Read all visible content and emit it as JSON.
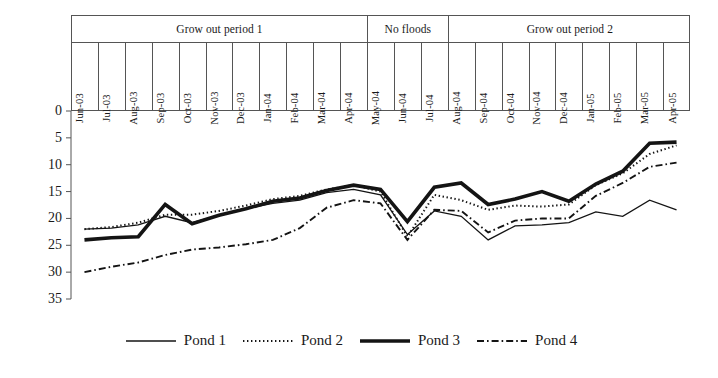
{
  "axis": {
    "y_ticks": [
      0,
      5,
      10,
      15,
      20,
      25,
      30,
      35
    ],
    "y_min": 0,
    "y_max": 35,
    "inverted": true
  },
  "groups": [
    {
      "label": "Grow out period 1",
      "start": 0,
      "end": 10
    },
    {
      "label": "No floods",
      "start": 11,
      "end": 13
    },
    {
      "label": "Grow out period 2",
      "start": 14,
      "end": 22
    }
  ],
  "legend": [
    {
      "label": "Pond 1",
      "style": "solid-thin"
    },
    {
      "label": "Pond 2",
      "style": "dotted"
    },
    {
      "label": "Pond 3",
      "style": "solid-thick"
    },
    {
      "label": "Pond 4",
      "style": "dash-dot"
    }
  ],
  "chart_data": {
    "type": "line",
    "title": "",
    "xlabel": "",
    "ylabel": "",
    "ylim": [
      0,
      35
    ],
    "y_inverted": true,
    "grid": false,
    "legend_position": "bottom",
    "annotations": [
      "Grow out period 1",
      "No floods",
      "Grow out period 2"
    ],
    "categories": [
      "Jun-03",
      "Jul-03",
      "Aug-03",
      "Sep-03",
      "Oct-03",
      "Nov-03",
      "Dec-03",
      "Jan-04",
      "Feb-04",
      "Mar-04",
      "Apr-04",
      "May-04",
      "Jun-04",
      "Jul-04",
      "Aug-04",
      "Sep-04",
      "Oct-04",
      "Nov-04",
      "Dec-04",
      "Jan-05",
      "Feb-05",
      "Mar-05",
      "Apr-05"
    ],
    "series": [
      {
        "name": "Pond 1",
        "style": "solid-thin",
        "values": [
          22.0,
          21.8,
          21.2,
          19.6,
          20.8,
          19.4,
          18.2,
          17.2,
          16.6,
          15.2,
          14.6,
          15.6,
          23.0,
          18.6,
          19.6,
          24.0,
          21.4,
          21.2,
          20.8,
          18.8,
          19.6,
          16.6,
          18.4
        ]
      },
      {
        "name": "Pond 2",
        "style": "dotted",
        "values": [
          22.0,
          21.6,
          20.8,
          19.3,
          19.3,
          18.6,
          17.6,
          16.4,
          15.8,
          14.6,
          13.8,
          15.0,
          23.4,
          15.6,
          16.6,
          18.4,
          17.6,
          17.8,
          17.4,
          13.8,
          11.6,
          8.0,
          6.4
        ]
      },
      {
        "name": "Pond 3",
        "style": "solid-thick",
        "values": [
          24.0,
          23.6,
          23.4,
          17.4,
          21.0,
          19.4,
          18.2,
          16.8,
          16.2,
          14.8,
          13.8,
          14.6,
          20.6,
          14.2,
          13.4,
          17.4,
          16.4,
          15.0,
          16.8,
          13.6,
          11.2,
          6.0,
          5.8
        ]
      },
      {
        "name": "Pond 4",
        "style": "dash-dot",
        "values": [
          30.0,
          29.0,
          28.2,
          26.8,
          25.8,
          25.4,
          24.8,
          24.0,
          21.8,
          18.0,
          16.6,
          17.2,
          24.0,
          18.4,
          18.6,
          22.6,
          20.4,
          20.0,
          20.0,
          15.8,
          13.4,
          10.4,
          9.6
        ]
      }
    ]
  }
}
